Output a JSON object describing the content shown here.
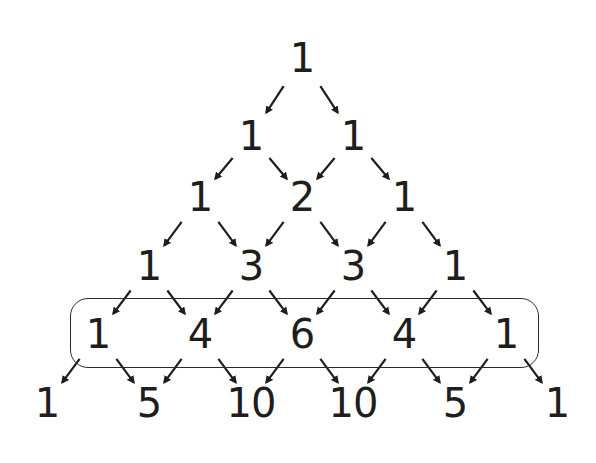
{
  "diagram": {
    "title": "",
    "type": "pascal-triangle",
    "rows": [
      [
        "1"
      ],
      [
        "1",
        "1"
      ],
      [
        "1",
        "2",
        "1"
      ],
      [
        "1",
        "3",
        "3",
        "1"
      ],
      [
        "1",
        "4",
        "6",
        "4",
        "1"
      ],
      [
        "1",
        "5",
        "10",
        "10",
        "5",
        "1"
      ]
    ],
    "highlighted_row_index": 4,
    "layout": {
      "center_x": 302,
      "half_step": 51,
      "row_y": [
        58,
        136,
        197,
        266,
        334,
        403
      ]
    },
    "colors": {
      "ink": "#1e1e1e",
      "box_stroke": "#2a2a2a",
      "background": "#ffffff"
    }
  }
}
